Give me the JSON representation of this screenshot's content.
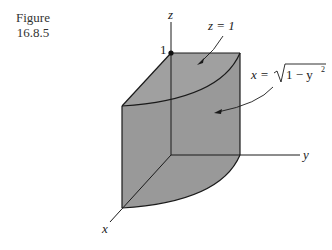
{
  "figure": {
    "label": "Figure",
    "number": "16.8.5"
  },
  "axes": {
    "z_label": "z",
    "y_label": "y",
    "x_label": "x",
    "z_tick": "1"
  },
  "annotations": {
    "top_face": "z = 1",
    "curved_face_lhs": "x = ",
    "curved_face_radicand": "1 − y",
    "curved_face_exp": "2"
  },
  "colors": {
    "solid_fill": "#9a9a9a",
    "edge": "#1a1a1a",
    "background": "#ffffff"
  }
}
